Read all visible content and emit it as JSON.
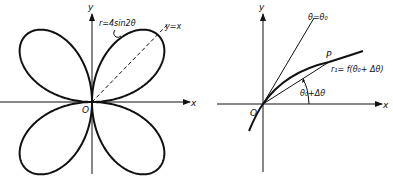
{
  "left_figure": {
    "axis_x_label": "x",
    "axis_y_label": "y",
    "origin_label": "O",
    "curve_label": "r=4sin2θ",
    "line_label": "y=x",
    "curve_equation": "r = 4 sin 2θ",
    "curve_type": "four-leaved rose"
  },
  "right_figure": {
    "axis_x_label": "x",
    "axis_y_label": "y",
    "origin_label": "O",
    "ray_label": "θ=θ₀",
    "point_label": "P",
    "radius_label": "r₁= f(θ₀+ Δθ)",
    "angle_label": "θ₀+Δθ"
  },
  "colors": {
    "ink": "#111111",
    "background": "#ffffff"
  }
}
